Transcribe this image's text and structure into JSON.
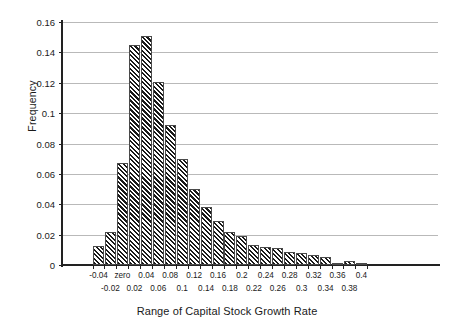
{
  "chart_data": {
    "type": "bar",
    "title": "",
    "subtitle": "",
    "xlabel": "Range of Capital Stock Growth Rate",
    "ylabel": "Frequency",
    "ylim": [
      0,
      0.16
    ],
    "y_ticks": [
      "0",
      "0.02",
      "0.04",
      "0.06",
      "0.08",
      "0.1",
      "0.12",
      "0.14",
      "0.16"
    ],
    "y_tick_values": [
      0,
      0.02,
      0.04,
      0.06,
      0.08,
      0.1,
      0.12,
      0.14,
      0.16
    ],
    "grid": true,
    "legend": false,
    "legend_position": "none",
    "bar_style": "diagonal-hatch",
    "categories": [
      "-0.04",
      "-0.02",
      "zero",
      "0.02",
      "0.04",
      "0.06",
      "0.08",
      "0.1",
      "0.12",
      "0.14",
      "0.16",
      "0.18",
      "0.2",
      "0.22",
      "0.24",
      "0.26",
      "0.28",
      "0.3",
      "0.32",
      "0.34",
      "0.36",
      "0.38",
      "0.4"
    ],
    "values": [
      0.0125,
      0.0215,
      0.067,
      0.145,
      0.151,
      0.1205,
      0.092,
      0.0695,
      0.05,
      0.038,
      0.029,
      0.0215,
      0.019,
      0.013,
      0.012,
      0.011,
      0.0085,
      0.008,
      0.0065,
      0.005,
      0.0015,
      0.0025,
      0.0015
    ]
  },
  "colors": {
    "axis": "#222222",
    "grid": "#b9b9b9",
    "bar_fill": "#1a1a1a",
    "background": "#ffffff",
    "text": "#1a1a1a"
  }
}
